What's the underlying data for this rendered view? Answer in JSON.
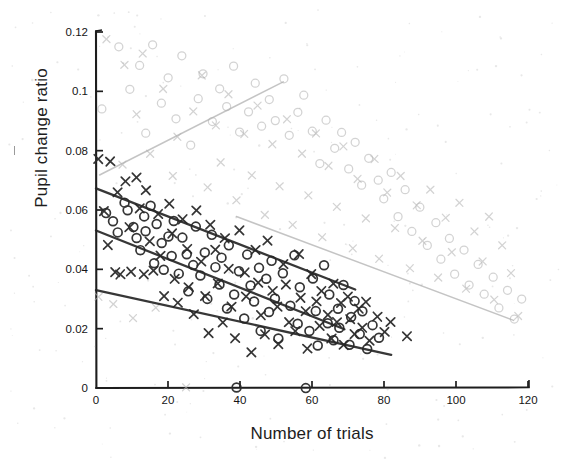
{
  "chart_data": {
    "type": "scatter",
    "title": "",
    "xlabel": "Number of trials",
    "ylabel": "Pupil change ratio",
    "xlim": [
      0,
      120
    ],
    "ylim": [
      0,
      0.12
    ],
    "xticks": [
      0,
      20,
      40,
      60,
      80,
      100,
      120
    ],
    "xtick_labels": [
      "0",
      "20",
      "40",
      "60",
      "80",
      "100",
      "120"
    ],
    "yticks": [
      0,
      0.02,
      0.04,
      0.06,
      0.08,
      0.1,
      0.12
    ],
    "ytick_labels": [
      "0",
      "0.02",
      "0.04",
      "0.06",
      "0.08",
      "0.1",
      "0.12"
    ],
    "grid": false,
    "legend": "none",
    "marker_shapes": [
      "circle",
      "cross"
    ],
    "colors": {
      "dark_marker": "#2b2b2b",
      "light_marker": "#b9b9b9",
      "dark_line": "#262626",
      "light_line": "#b0b0b0",
      "axis": "#1d1d1d"
    },
    "trend_lines": [
      {
        "name": "light-ascending",
        "shade": "light",
        "x": [
          1,
          52
        ],
        "y": [
          0.0718,
          0.1032
        ]
      },
      {
        "name": "light-descending",
        "shade": "light",
        "x": [
          39,
          116
        ],
        "y": [
          0.0578,
          0.0228
        ]
      },
      {
        "name": "dark-upper",
        "shade": "dark",
        "x": [
          0,
          72
        ],
        "y": [
          0.0673,
          0.0332
        ]
      },
      {
        "name": "dark-middle",
        "shade": "dark",
        "x": [
          0,
          69
        ],
        "y": [
          0.0531,
          0.0198
        ]
      },
      {
        "name": "dark-lower",
        "shade": "dark",
        "x": [
          0,
          82
        ],
        "y": [
          0.033,
          0.0112
        ]
      }
    ],
    "series": [
      {
        "name": "dark-circles",
        "shade": "dark",
        "marker": "circle",
        "points": [
          [
            3,
            0.0585
          ],
          [
            5,
            0.056
          ],
          [
            6,
            0.052
          ],
          [
            8,
            0.0627
          ],
          [
            9,
            0.0598
          ],
          [
            10,
            0.0545
          ],
          [
            11,
            0.0505
          ],
          [
            12,
            0.0468
          ],
          [
            13,
            0.058
          ],
          [
            14,
            0.0533
          ],
          [
            15,
            0.0612
          ],
          [
            16,
            0.0425
          ],
          [
            17,
            0.0556
          ],
          [
            18,
            0.0492
          ],
          [
            19,
            0.0398
          ],
          [
            20,
            0.0515
          ],
          [
            21,
            0.0447
          ],
          [
            22,
            0.0568
          ],
          [
            23,
            0.0386
          ],
          [
            24,
            0.0502
          ],
          [
            25,
            0.0455
          ],
          [
            26,
            0.033
          ],
          [
            27,
            0.0418
          ],
          [
            28,
            0.054
          ],
          [
            29,
            0.0378
          ],
          [
            30,
            0.046
          ],
          [
            31,
            0.0296
          ],
          [
            32,
            0.0512
          ],
          [
            33,
            0.0404
          ],
          [
            34,
            0.0352
          ],
          [
            35,
            0.0438
          ],
          [
            36,
            0.0268
          ],
          [
            37,
            0.0482
          ],
          [
            38,
            0.0318
          ],
          [
            39,
            0.0
          ],
          [
            40,
            0.0398
          ],
          [
            41,
            0.0231
          ],
          [
            42,
            0.0445
          ],
          [
            43,
            0.0348
          ],
          [
            44,
            0.029
          ],
          [
            45,
            0.0408
          ],
          [
            46,
            0.0192
          ],
          [
            47,
            0.0372
          ],
          [
            48,
            0.0255
          ],
          [
            49,
            0.043
          ],
          [
            50,
            0.0305
          ],
          [
            51,
            0.0168
          ],
          [
            52,
            0.0388
          ],
          [
            54,
            0.0276
          ],
          [
            55,
            0.0452
          ],
          [
            56,
            0.0214
          ],
          [
            57,
            0.034
          ],
          [
            58,
            0.0
          ],
          [
            59,
            0.0188
          ],
          [
            60,
            0.0372
          ],
          [
            61,
            0.0262
          ],
          [
            62,
            0.0138
          ],
          [
            63,
            0.0418
          ],
          [
            64,
            0.0222
          ],
          [
            65,
            0.0318
          ],
          [
            66,
            0.0165
          ],
          [
            67,
            0.0268
          ],
          [
            68,
            0.0202
          ],
          [
            69,
            0.0348
          ],
          [
            70,
            0.0145
          ],
          [
            71,
            0.024
          ],
          [
            72,
            0.0295
          ],
          [
            73,
            0.0182
          ],
          [
            74,
            0.0258
          ],
          [
            75,
            0.0128
          ],
          [
            77,
            0.0215
          ],
          [
            79,
            0.0168
          ]
        ]
      },
      {
        "name": "dark-crosses",
        "shade": "dark",
        "marker": "cross",
        "points": [
          [
            1,
            0.0775
          ],
          [
            2,
            0.06
          ],
          [
            3,
            0.0478
          ],
          [
            4,
            0.076
          ],
          [
            5,
            0.0392
          ],
          [
            6,
            0.0655
          ],
          [
            7,
            0.0388
          ],
          [
            8,
            0.07
          ],
          [
            9,
            0.0545
          ],
          [
            10,
            0.039
          ],
          [
            11,
            0.0712
          ],
          [
            12,
            0.0608
          ],
          [
            13,
            0.0385
          ],
          [
            14,
            0.0662
          ],
          [
            15,
            0.0498
          ],
          [
            16,
            0.0392
          ],
          [
            17,
            0.0585
          ],
          [
            18,
            0.0448
          ],
          [
            19,
            0.0312
          ],
          [
            20,
            0.062
          ],
          [
            21,
            0.0518
          ],
          [
            22,
            0.0372
          ],
          [
            23,
            0.0285
          ],
          [
            24,
            0.0565
          ],
          [
            25,
            0.0472
          ],
          [
            26,
            0.0336
          ],
          [
            27,
            0.0248
          ],
          [
            28,
            0.0598
          ],
          [
            29,
            0.0428
          ],
          [
            30,
            0.0305
          ],
          [
            31,
            0.0186
          ],
          [
            32,
            0.0552
          ],
          [
            33,
            0.0465
          ],
          [
            34,
            0.0348
          ],
          [
            35,
            0.0222
          ],
          [
            36,
            0.0508
          ],
          [
            37,
            0.0402
          ],
          [
            38,
            0.0272
          ],
          [
            39,
            0.0168
          ],
          [
            40,
            0.0528
          ],
          [
            41,
            0.0388
          ],
          [
            42,
            0.0312
          ],
          [
            43,
            0.0118
          ],
          [
            44,
            0.0462
          ],
          [
            45,
            0.0355
          ],
          [
            46,
            0.0248
          ],
          [
            47,
            0.0182
          ],
          [
            48,
            0.0498
          ],
          [
            49,
            0.033
          ],
          [
            50,
            0.0276
          ],
          [
            51,
            0.0148
          ],
          [
            52,
            0.0418
          ],
          [
            53,
            0.0352
          ],
          [
            54,
            0.0222
          ],
          [
            55,
            0.0192
          ],
          [
            56,
            0.0448
          ],
          [
            57,
            0.0308
          ],
          [
            58,
            0.0262
          ],
          [
            59,
            0.0135
          ],
          [
            60,
            0.0382
          ],
          [
            61,
            0.0295
          ],
          [
            62,
            0.0205
          ],
          [
            63,
            0.0328
          ],
          [
            64,
            0.0248
          ],
          [
            65,
            0.0162
          ],
          [
            66,
            0.0352
          ],
          [
            67,
            0.0218
          ],
          [
            68,
            0.0285
          ],
          [
            69,
            0.0148
          ],
          [
            70,
            0.0312
          ],
          [
            71,
            0.0232
          ],
          [
            72,
            0.0178
          ],
          [
            73,
            0.0268
          ],
          [
            74,
            0.0205
          ],
          [
            75,
            0.0295
          ],
          [
            76,
            0.0158
          ],
          [
            78,
            0.0242
          ],
          [
            80,
            0.0188
          ],
          [
            82,
            0.0225
          ],
          [
            86,
            0.0172
          ]
        ]
      },
      {
        "name": "light-circles",
        "shade": "light",
        "marker": "circle",
        "points": [
          [
            2,
            0.0938
          ],
          [
            6,
            0.1148
          ],
          [
            9,
            0.1005
          ],
          [
            12,
            0.1092
          ],
          [
            14,
            0.0858
          ],
          [
            16,
            0.1158
          ],
          [
            18,
            0.0962
          ],
          [
            20,
            0.1048
          ],
          [
            22,
            0.0905
          ],
          [
            24,
            0.1115
          ],
          [
            26,
            0.0822
          ],
          [
            28,
            0.0978
          ],
          [
            30,
            0.1062
          ],
          [
            32,
            0.0895
          ],
          [
            34,
            0.1008
          ],
          [
            36,
            0.0945
          ],
          [
            38,
            0.1088
          ],
          [
            40,
            0.0862
          ],
          [
            42,
            0.0932
          ],
          [
            44,
            0.1025
          ],
          [
            46,
            0.0885
          ],
          [
            48,
            0.0968
          ],
          [
            50,
            0.0902
          ],
          [
            52,
            0.1045
          ],
          [
            54,
            0.0848
          ],
          [
            56,
            0.0925
          ],
          [
            58,
            0.0982
          ],
          [
            60,
            0.0868
          ],
          [
            62,
            0.0758
          ],
          [
            64,
            0.0905
          ],
          [
            66,
            0.0812
          ],
          [
            68,
            0.0862
          ],
          [
            70,
            0.0742
          ],
          [
            72,
            0.0825
          ],
          [
            74,
            0.0688
          ],
          [
            76,
            0.0778
          ],
          [
            78,
            0.0705
          ],
          [
            80,
            0.0635
          ],
          [
            82,
            0.0722
          ],
          [
            84,
            0.0582
          ],
          [
            86,
            0.0665
          ],
          [
            88,
            0.0528
          ],
          [
            90,
            0.0612
          ],
          [
            92,
            0.0478
          ],
          [
            94,
            0.0558
          ],
          [
            96,
            0.0432
          ],
          [
            98,
            0.0505
          ],
          [
            100,
            0.0388
          ],
          [
            102,
            0.0462
          ],
          [
            104,
            0.0348
          ],
          [
            106,
            0.0418
          ],
          [
            108,
            0.0312
          ],
          [
            110,
            0.0378
          ],
          [
            112,
            0.0268
          ],
          [
            114,
            0.0332
          ],
          [
            116,
            0.0228
          ],
          [
            118,
            0.0295
          ]
        ]
      },
      {
        "name": "light-crosses",
        "shade": "light",
        "marker": "cross",
        "points": [
          [
            1,
            0.0312
          ],
          [
            3,
            0.1175
          ],
          [
            5,
            0.0285
          ],
          [
            7,
            0.0755
          ],
          [
            8,
            0.1088
          ],
          [
            10,
            0.0232
          ],
          [
            11,
            0.0925
          ],
          [
            13,
            0.1132
          ],
          [
            15,
            0.0788
          ],
          [
            17,
            0.0268
          ],
          [
            19,
            0.1005
          ],
          [
            21,
            0.0715
          ],
          [
            23,
            0.0845
          ],
          [
            25,
            0.0
          ],
          [
            27,
            0.0935
          ],
          [
            29,
            0.1058
          ],
          [
            31,
            0.0672
          ],
          [
            33,
            0.0888
          ],
          [
            35,
            0.0762
          ],
          [
            37,
            0.0995
          ],
          [
            39,
            0.0628
          ],
          [
            41,
            0.0858
          ],
          [
            43,
            0.0712
          ],
          [
            45,
            0.0948
          ],
          [
            47,
            0.0588
          ],
          [
            49,
            0.0822
          ],
          [
            51,
            0.0678
          ],
          [
            53,
            0.0902
          ],
          [
            55,
            0.0545
          ],
          [
            57,
            0.0788
          ],
          [
            59,
            0.0645
          ],
          [
            61,
            0.0858
          ],
          [
            63,
            0.0508
          ],
          [
            65,
            0.0745
          ],
          [
            67,
            0.0608
          ],
          [
            69,
            0.0812
          ],
          [
            71,
            0.0472
          ],
          [
            73,
            0.0702
          ],
          [
            75,
            0.0572
          ],
          [
            77,
            0.0768
          ],
          [
            79,
            0.0438
          ],
          [
            81,
            0.0658
          ],
          [
            83,
            0.0535
          ],
          [
            85,
            0.0715
          ],
          [
            87,
            0.0402
          ],
          [
            89,
            0.0615
          ],
          [
            91,
            0.0498
          ],
          [
            93,
            0.0668
          ],
          [
            95,
            0.0368
          ],
          [
            97,
            0.0572
          ],
          [
            99,
            0.0458
          ],
          [
            101,
            0.0622
          ],
          [
            103,
            0.0335
          ],
          [
            105,
            0.0528
          ],
          [
            107,
            0.0422
          ],
          [
            109,
            0.0578
          ],
          [
            111,
            0.0302
          ],
          [
            113,
            0.0485
          ],
          [
            115,
            0.0392
          ],
          [
            117,
            0.0238
          ]
        ]
      }
    ]
  }
}
